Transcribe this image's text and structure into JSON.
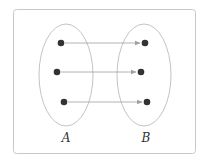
{
  "diagram": {
    "type": "set-mapping",
    "sets": [
      {
        "id": "A",
        "label": "A"
      },
      {
        "id": "B",
        "label": "B"
      }
    ],
    "elements": {
      "A": [
        {
          "id": "a1"
        },
        {
          "id": "a2"
        },
        {
          "id": "a3"
        }
      ],
      "B": [
        {
          "id": "b1"
        },
        {
          "id": "b2"
        },
        {
          "id": "b3"
        }
      ]
    },
    "mappings": [
      {
        "from": "a1",
        "to": "b1"
      },
      {
        "from": "a2",
        "to": "b2"
      },
      {
        "from": "a3",
        "to": "b3"
      }
    ],
    "colors": {
      "frame": "#c8c8c8",
      "ellipse": "#b4b4b4",
      "dot": "#333333",
      "arrow": "#a0a0a0"
    }
  },
  "labels": {
    "set_a": "A",
    "set_b": "B"
  }
}
